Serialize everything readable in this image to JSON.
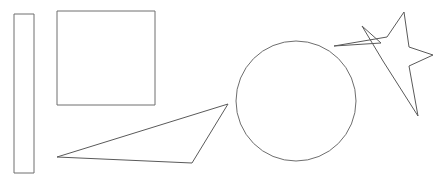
{
  "canvas": {
    "width": 437,
    "height": 180,
    "background_color": "#ffffff",
    "title": "Shapes Canvas"
  },
  "style": {
    "stroke_color": "#6e6e6e",
    "stroke_color_dark": "#5a5a5a",
    "stroke_width": 1,
    "fill": "none"
  },
  "shapes": [
    {
      "id": "thin-rectangle",
      "name": "thin vertical rectangle",
      "type": "rect",
      "x": 14,
      "y": 14,
      "width": 20,
      "height": 159,
      "stroke": "#6e6e6e"
    },
    {
      "id": "square",
      "name": "square",
      "type": "rect",
      "x": 57,
      "y": 11,
      "width": 98,
      "height": 94,
      "stroke": "#6e6e6e"
    },
    {
      "id": "triangle",
      "name": "thin scalene triangle",
      "type": "polygon",
      "points": "57,157 228,104 192,163",
      "stroke": "#5a5a5a"
    },
    {
      "id": "circle",
      "name": "circle",
      "type": "circle",
      "cx": 296,
      "cy": 101,
      "r": 60,
      "stroke": "#6e6e6e"
    },
    {
      "id": "star",
      "name": "five pointed star",
      "type": "polygon",
      "points": "404,12 409,47 433,55 409,66 418,116 383,61 362,26 381,43 334,46 387,37",
      "stroke": "#5a5a5a"
    }
  ]
}
